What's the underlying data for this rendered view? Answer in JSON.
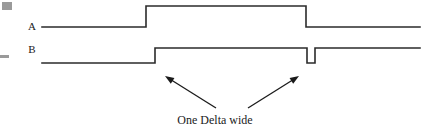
{
  "figure": {
    "kind": "timing-diagram",
    "width": 430,
    "height": 130,
    "background": "#ffffff",
    "line_color": "#2b2b2b",
    "text_color": "#1a1a1a",
    "mark_color": "#9a9a9a"
  },
  "signals": [
    {
      "label": "A",
      "label_x": 32,
      "label_y": 26,
      "low_y": 27,
      "high_y": 6,
      "start_x": 42,
      "end_x": 420,
      "transitions": [
        {
          "x": 146,
          "to": "high"
        },
        {
          "x": 306,
          "to": "low"
        }
      ]
    },
    {
      "label": "B",
      "label_x": 32,
      "label_y": 49,
      "low_y": 63,
      "high_y": 48,
      "start_x": 42,
      "end_x": 420,
      "transitions": [
        {
          "x": 147,
          "to": "low"
        },
        {
          "x": 155,
          "to": "high"
        },
        {
          "x": 307,
          "to": "low"
        },
        {
          "x": 315,
          "to": "high"
        }
      ]
    }
  ],
  "annotations": {
    "caption": "One Delta wide",
    "caption_x": 215,
    "caption_y": 124,
    "arrows": [
      {
        "name": "left-arrow",
        "from_x": 216,
        "from_y": 108,
        "to_x": 165,
        "to_y": 76
      },
      {
        "name": "right-arrow",
        "from_x": 248,
        "from_y": 108,
        "to_x": 299,
        "to_y": 76
      }
    ]
  },
  "edge_marks": [
    {
      "name": "top-left-mark",
      "x": 2,
      "y": 2,
      "w": 10,
      "h": 8
    },
    {
      "name": "mid-left-mark",
      "x": 0,
      "y": 55,
      "w": 9,
      "h": 3
    }
  ]
}
